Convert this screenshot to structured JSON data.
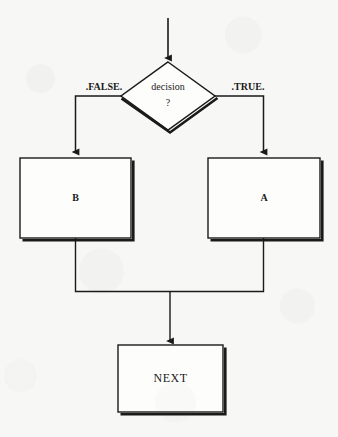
{
  "diagram": {
    "type": "flowchart",
    "title": "",
    "background_color": "#f7f7f6",
    "stroke_color": "#1a1a1a",
    "fill_color": "#fdfdfc",
    "nodes": [
      {
        "id": "entry",
        "shape": "arrow",
        "label": "",
        "x": 168,
        "y": 18,
        "to_y": 62
      },
      {
        "id": "decision",
        "shape": "diamond",
        "label_line1": "decision",
        "label_line2": "?",
        "cx": 168,
        "cy": 96,
        "half_width": 47,
        "half_height": 34
      },
      {
        "id": "process_b",
        "shape": "rectangle",
        "label": "B",
        "x": 20,
        "y": 158,
        "width": 111,
        "height": 80
      },
      {
        "id": "process_a",
        "shape": "rectangle",
        "label": "A",
        "x": 208,
        "y": 158,
        "width": 112,
        "height": 80
      },
      {
        "id": "next",
        "shape": "rectangle",
        "label": "NEXT",
        "x": 118,
        "y": 345,
        "width": 105,
        "height": 67
      }
    ],
    "edges": [
      {
        "id": "edge-false",
        "from": "decision",
        "to": "process_b",
        "label": ".FALSE.",
        "label_x": 104,
        "label_y": 88,
        "route": "left-then-down"
      },
      {
        "id": "edge-true",
        "from": "decision",
        "to": "process_a",
        "label": ".TRUE.",
        "label_x": 243,
        "label_y": 88,
        "route": "right-then-down"
      },
      {
        "id": "edge-b-merge",
        "from": "process_b",
        "to": "merge",
        "label": "",
        "route": "down-then-right"
      },
      {
        "id": "edge-a-merge",
        "from": "process_a",
        "to": "merge",
        "label": "",
        "route": "down-then-left"
      },
      {
        "id": "edge-merge-next",
        "from": "merge",
        "to": "next",
        "label": "",
        "route": "down"
      }
    ]
  }
}
